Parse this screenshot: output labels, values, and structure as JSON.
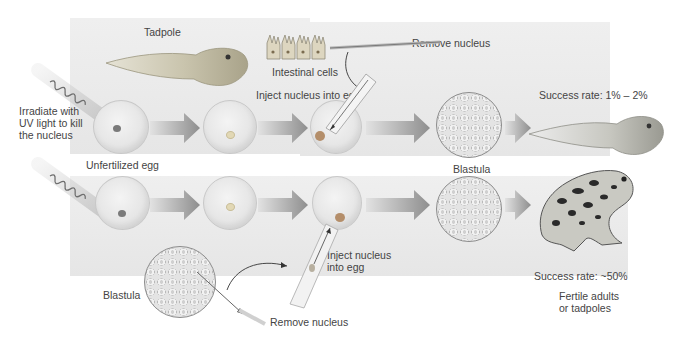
{
  "figure": {
    "top_row": {
      "donor_label": "Tadpole",
      "donor_cells_label": "Intestinal cells",
      "remove_nucleus_label": "Remove nucleus",
      "inject_label": "Inject nucleus into egg",
      "irradiate_label": "Irradiate with UV light to kill the nucleus",
      "egg_label": "Unfertilized egg",
      "blastula_label": "Blastula",
      "success_label": "Success rate: 1% – 2%",
      "result": "tadpole"
    },
    "bottom_row": {
      "donor_label": "Blastula",
      "remove_nucleus_label": "Remove nucleus",
      "inject_label": "Inject nucleus into egg",
      "success_label": "Success rate: ~50%",
      "result_label": "Fertile adults or tadpoles",
      "result": "frog"
    },
    "colors": {
      "panel": "#ebebeb",
      "arrow_dark": "#8f8f8f",
      "arrow_light": "#dcdcdc",
      "egg": "#e6e6e6",
      "nucleus": "#9a8f7a",
      "text": "#444444"
    }
  }
}
